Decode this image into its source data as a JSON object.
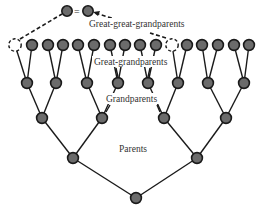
{
  "diagram": {
    "labels": {
      "great_great_grandparents": "Great-great-grandparents",
      "great_grandparents": "Great-grandparents",
      "grandparents": "Grandparents",
      "parents": "Parents",
      "equals": "="
    },
    "colors": {
      "node_fill": "#6b6b6b",
      "node_stroke": "#1a1a1a",
      "line": "#1a1a1a",
      "text": "#333333"
    },
    "generations": [
      {
        "name": "Child",
        "count": 1
      },
      {
        "name": "Parents",
        "count": 2
      },
      {
        "name": "Grandparents",
        "count": 4
      },
      {
        "name": "Great-grandparents",
        "count": 8
      },
      {
        "name": "Great-great-grandparents",
        "count": 16,
        "duplicated_positions": [
          1,
          11
        ]
      }
    ],
    "note": "Two great-great-grandparent positions (dashed) are the same individual"
  }
}
